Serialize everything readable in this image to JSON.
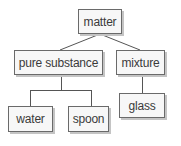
{
  "diagram": {
    "type": "tree",
    "nodes": {
      "root": {
        "label": "matter"
      },
      "pure_substance": {
        "label": "pure substance"
      },
      "mixture": {
        "label": "mixture"
      },
      "water": {
        "label": "water"
      },
      "spoon": {
        "label": "spoon"
      },
      "glass": {
        "label": "glass"
      }
    },
    "edges": [
      [
        "matter",
        "pure substance"
      ],
      [
        "matter",
        "mixture"
      ],
      [
        "pure substance",
        "water"
      ],
      [
        "pure substance",
        "spoon"
      ],
      [
        "mixture",
        "glass"
      ]
    ],
    "colors": {
      "box_fill": "#f7f7f7",
      "box_border": "#6a6a6a",
      "shadow": "#c4c4c4",
      "line": "#555555",
      "text": "#3a3a3a"
    }
  }
}
